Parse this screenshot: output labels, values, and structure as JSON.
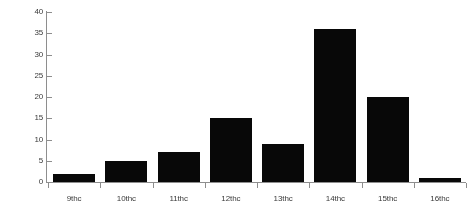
{
  "chart_data": {
    "type": "bar",
    "title": "",
    "subtitle": "",
    "xlabel": "",
    "ylabel": "",
    "categories": [
      "9thc",
      "10thc",
      "11thc",
      "12thc",
      "13thc",
      "14thc",
      "15thc",
      "16thc"
    ],
    "values": [
      2,
      5,
      7,
      15,
      9,
      36,
      20,
      1
    ],
    "series": [
      {
        "name": "",
        "values": [
          2,
          5,
          7,
          15,
          9,
          36,
          20,
          1
        ]
      }
    ],
    "ylim": [
      0,
      40
    ],
    "ytick_labels": [
      "0",
      "5",
      "10",
      "15",
      "20",
      "25",
      "30",
      "35",
      "40"
    ],
    "ytick_values": [
      0,
      5,
      10,
      15,
      20,
      25,
      30,
      35,
      40
    ],
    "ytick_step": 5,
    "grid": false,
    "legend": false,
    "legend_position": "none",
    "annotations": [],
    "bar_color": "#080808",
    "axis_color": "#8e8e8e",
    "background_color": "#ffffff"
  }
}
